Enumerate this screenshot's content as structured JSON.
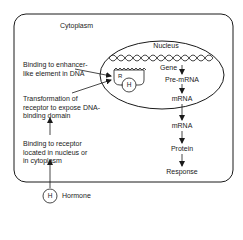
{
  "diagram": {
    "compartments": {
      "cytoplasm": "Cytoplasm",
      "nucleus": "Nucleus"
    },
    "dna": {
      "gene_label": "Gene",
      "receptor_label": "R",
      "hormone_bound_label": "H"
    },
    "left_steps": [
      {
        "line1": "Binding to enhancer-",
        "line2": "like element in DNA",
        "line3": ""
      },
      {
        "line1": "Transformation of",
        "line2": "receptor to expose DNA-",
        "line3": "binding domain"
      },
      {
        "line1": "Binding to receptor",
        "line2": "located in nucleus or",
        "line3": "in cytoplasm"
      }
    ],
    "right_flow": [
      "Pre-mRNA",
      "mRNA",
      "mRNA",
      "Protein",
      "Response"
    ],
    "hormone": {
      "symbol": "H",
      "label": "Hormone"
    },
    "colors": {
      "stroke": "#1a1a1a",
      "background": "#ffffff"
    }
  }
}
